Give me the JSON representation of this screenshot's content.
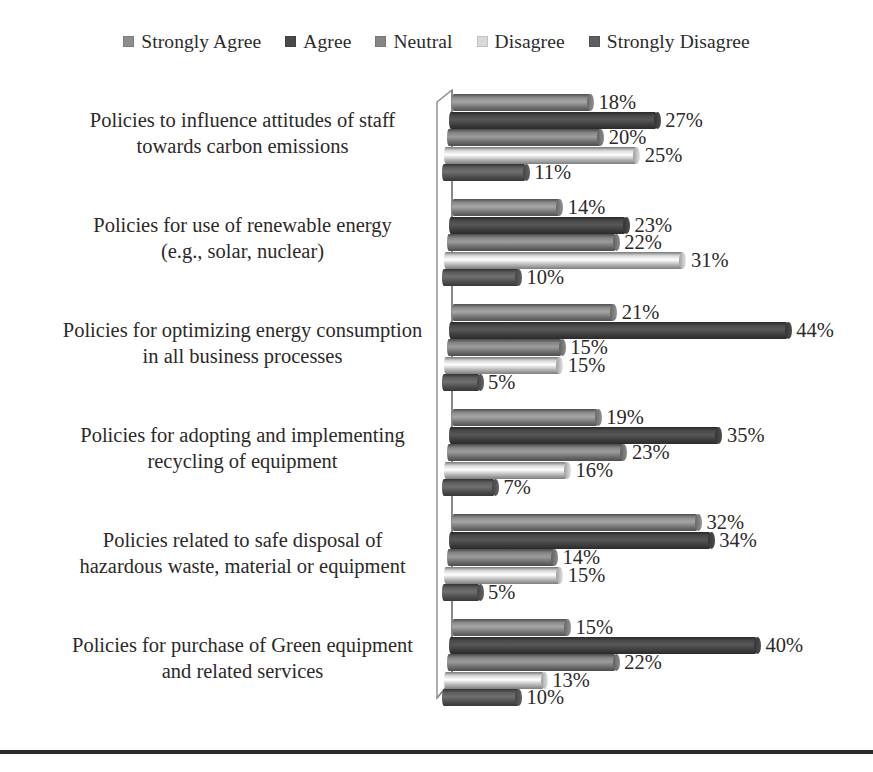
{
  "legend": {
    "position": "top-center",
    "items": [
      {
        "label": "Strongly Agree",
        "color": "#8d8d8d",
        "icon": "square-swatch-icon"
      },
      {
        "label": "Agree",
        "color": "#4a4a4a",
        "icon": "square-swatch-icon"
      },
      {
        "label": "Neutral",
        "color": "#858585",
        "icon": "square-swatch-icon"
      },
      {
        "label": "Disagree",
        "color": "#d9d9d9",
        "icon": "square-swatch-icon"
      },
      {
        "label": "Strongly Disagree",
        "color": "#5e5e5e",
        "icon": "square-swatch-icon"
      }
    ]
  },
  "chart_data": {
    "type": "bar",
    "orientation": "horizontal",
    "style": "3d-cylinder-grouped",
    "title": "",
    "xlabel": "",
    "ylabel": "",
    "grid": false,
    "axis_range": [
      0,
      50
    ],
    "value_suffix": "%",
    "categories": [
      "Policies to influence attitudes of staff towards carbon emissions",
      "Policies for use of renewable energy (e.g., solar, nuclear)",
      "Policies for optimizing energy consumption in all business processes",
      "Policies for adopting and implementing recycling of equipment",
      "Policies related to safe disposal of hazardous waste, material or equipment",
      "Policies for purchase of Green equipment and related services"
    ],
    "category_lines": [
      [
        "Policies to influence attitudes of staff",
        "towards carbon emissions"
      ],
      [
        "Policies for use of renewable energy",
        "(e.g., solar, nuclear)"
      ],
      [
        "Policies for optimizing energy consumption",
        "in all business processes"
      ],
      [
        "Policies for adopting and implementing",
        "recycling of equipment"
      ],
      [
        "Policies related to safe disposal of",
        "hazardous waste, material or equipment"
      ],
      [
        "Policies for purchase of Green equipment",
        "and related services"
      ]
    ],
    "series": [
      {
        "name": "Strongly Agree",
        "color": "#8d8d8d",
        "values": [
          18,
          14,
          21,
          19,
          32,
          15
        ]
      },
      {
        "name": "Agree",
        "color": "#4a4a4a",
        "values": [
          27,
          23,
          44,
          35,
          34,
          40
        ]
      },
      {
        "name": "Neutral",
        "color": "#858585",
        "values": [
          20,
          22,
          15,
          23,
          14,
          22
        ]
      },
      {
        "name": "Disagree",
        "color": "#d9d9d9",
        "values": [
          25,
          31,
          15,
          16,
          15,
          13
        ]
      },
      {
        "name": "Strongly Disagree",
        "color": "#5e5e5e",
        "values": [
          11,
          10,
          5,
          7,
          5,
          10
        ]
      }
    ],
    "labels": [
      [
        "18%",
        "27%",
        "20%",
        "25%",
        "11%"
      ],
      [
        "14%",
        "23%",
        "22%",
        "31%",
        "10%"
      ],
      [
        "21%",
        "44%",
        "15%",
        "15%",
        "5%"
      ],
      [
        "19%",
        "35%",
        "23%",
        "16%",
        "7%"
      ],
      [
        "32%",
        "34%",
        "14%",
        "15%",
        "5%"
      ],
      [
        "15%",
        "40%",
        "22%",
        "13%",
        "10%"
      ]
    ]
  }
}
